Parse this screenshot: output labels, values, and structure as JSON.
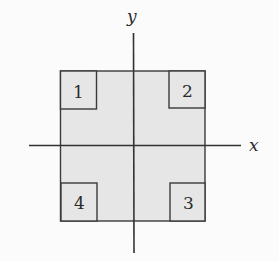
{
  "diagram": {
    "axes": {
      "x_label": "x",
      "y_label": "y"
    },
    "region": {
      "fill": "#e6e6e6",
      "stroke": "#333333"
    },
    "corner_boxes": [
      {
        "label": "1",
        "position": "top-left"
      },
      {
        "label": "2",
        "position": "top-right"
      },
      {
        "label": "3",
        "position": "bottom-right"
      },
      {
        "label": "4",
        "position": "bottom-left"
      }
    ]
  }
}
